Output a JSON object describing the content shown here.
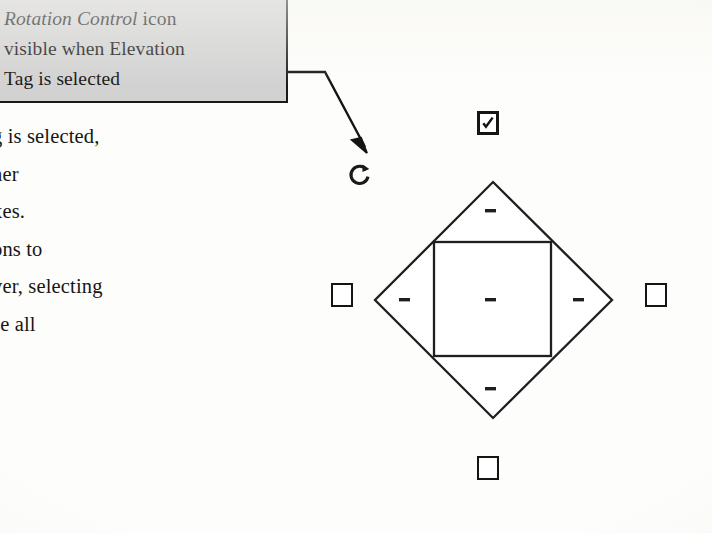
{
  "page": {
    "width": 712,
    "height": 533,
    "background_color": "#fdfdfb",
    "ink_color": "#161616"
  },
  "callout": {
    "name": "rotation-control-callout",
    "fill_color": "#d2d2d2",
    "border_color": "#1a1a1a",
    "lines": [
      {
        "italic_text": "Rotation Control",
        "plain_text": " icon"
      },
      {
        "italic_text": "",
        "plain_text": "visible when Elevation"
      },
      {
        "italic_text": "",
        "plain_text": "Tag is selected"
      }
    ],
    "line_1_italic": "Rotation Control",
    "line_1_plain": " icon",
    "line_2": "visible when Elevation",
    "line_3": "Tag is selected"
  },
  "leader": {
    "name": "callout-leader-line",
    "color": "#151515",
    "arrow_target": "rotation-control-icon"
  },
  "body_text": {
    "name": "body-paragraph-clipped",
    "note_clipped_left": true,
    "lines": [
      "g is selected,",
      "her",
      "xes.",
      "ons to",
      "ver, selecting",
      "se all"
    ]
  },
  "rotation_icon": {
    "name": "rotation-control-icon",
    "glyph": "circular-arrow",
    "color": "#1a1a1a"
  },
  "checkboxes": [
    {
      "id": "checkbox-top",
      "position": "top",
      "checked": true,
      "label": ""
    },
    {
      "id": "checkbox-left",
      "position": "left",
      "checked": false,
      "label": ""
    },
    {
      "id": "checkbox-right",
      "position": "right",
      "checked": false,
      "label": ""
    },
    {
      "id": "checkbox-bottom",
      "position": "bottom",
      "checked": false,
      "label": ""
    }
  ],
  "figure": {
    "name": "elevation-tag-diamond",
    "stroke_color": "#1f1f1f",
    "fill_color": "#ffffff",
    "diamond": {
      "top": [
        133,
        14
      ],
      "right": [
        252,
        132
      ],
      "bottom": [
        133,
        250
      ],
      "left": [
        15,
        132
      ]
    },
    "inner_square": {
      "x": 74,
      "y": 74,
      "width": 117,
      "height": 114
    },
    "dash_marks": [
      {
        "name": "dash-top",
        "cx": 130,
        "cy": 44
      },
      {
        "name": "dash-left",
        "cx": 44,
        "cy": 132
      },
      {
        "name": "dash-center",
        "cx": 130,
        "cy": 132
      },
      {
        "name": "dash-right",
        "cx": 218,
        "cy": 132
      },
      {
        "name": "dash-bottom",
        "cx": 130,
        "cy": 221
      }
    ]
  }
}
